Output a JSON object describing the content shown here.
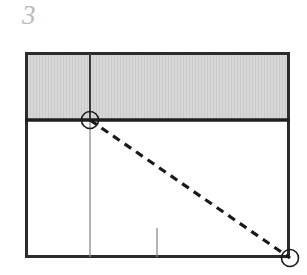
{
  "figure": {
    "label": "3",
    "label_color": "#b9b9b9",
    "background": "#ffffff"
  },
  "diagram": {
    "type": "geometric-construction",
    "frame": {
      "name": "outer-rectangle",
      "x": 25,
      "y": 52,
      "width": 265,
      "height": 206,
      "stroke": "#2b2b2b",
      "stroke_width": 3,
      "fill": "#ffffff"
    },
    "shaded_band": {
      "name": "shaded-region",
      "x": 25,
      "y": 52,
      "width": 265,
      "height": 68,
      "fill": "#d5d5d5",
      "stripe": "#c9c9c9",
      "description": "light gray hatched band across top of rectangle"
    },
    "divider_line": {
      "name": "horizontal-divider",
      "x1": 25,
      "y1": 120,
      "x2": 290,
      "y2": 120,
      "stroke": "#1f1f1f",
      "stroke_width": 3.5
    },
    "vertical_line_upper": {
      "name": "vertical-line-in-band",
      "x1": 90,
      "y1": 52,
      "x2": 90,
      "y2": 120,
      "stroke": "#3a3a3a",
      "stroke_width": 2
    },
    "vertical_line_lower": {
      "name": "vertical-line-below-band",
      "x1": 90,
      "y1": 120,
      "x2": 90,
      "y2": 258,
      "stroke": "#7d7d7d",
      "stroke_width": 1.3
    },
    "tick_mark": {
      "name": "bottom-tick-mark",
      "x1": 157,
      "y1": 228,
      "x2": 157,
      "y2": 258,
      "stroke": "#7d7d7d",
      "stroke_width": 1.3
    },
    "dashed_line": {
      "name": "dashed-diagonal",
      "x1": 90,
      "y1": 120,
      "x2": 290,
      "y2": 258,
      "stroke": "#1a1a1a",
      "stroke_width": 3.2,
      "dash": "8 6"
    },
    "markers": [
      {
        "name": "marker-upper-left",
        "cx": 90,
        "cy": 120,
        "r": 8.5,
        "stroke": "#1a1a1a",
        "stroke_width": 1.6,
        "fill": "none"
      },
      {
        "name": "marker-lower-right",
        "cx": 290,
        "cy": 258,
        "r": 8.5,
        "stroke": "#1a1a1a",
        "stroke_width": 1.6,
        "fill": "none"
      }
    ]
  }
}
